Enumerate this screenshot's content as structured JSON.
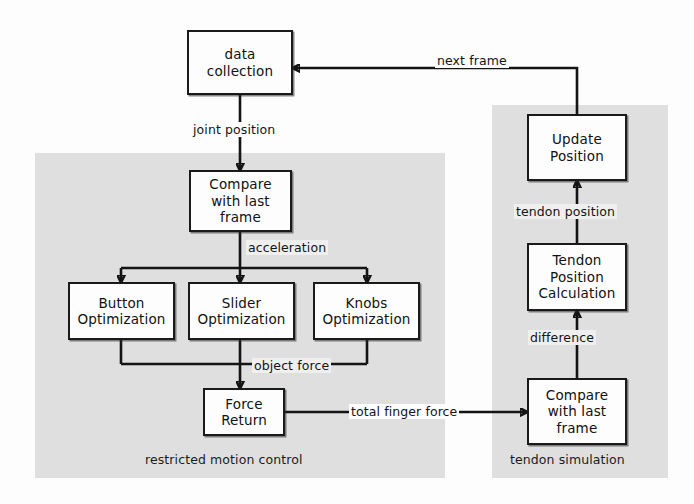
{
  "diagram": {
    "panels": [
      {
        "id": "restricted-motion-control",
        "label": "restricted motion control",
        "color": "#dcdcdc"
      },
      {
        "id": "tendon-simulation",
        "label": "tendon simulation",
        "color": "#dcdcdc"
      }
    ],
    "nodes": {
      "data_collection": "data collection",
      "compare_last_frame_left": "Compare with last frame",
      "button_optimization": "Button Optimization",
      "slider_optimization": "Slider Optimization",
      "knobs_optimization": "Knobs Optimization",
      "force_return": "Force Return",
      "update_position": "Update Position",
      "tendon_position_calculation": "Tendon Position Calculation",
      "compare_last_frame_right": "Compare with last frame"
    },
    "node_lines": {
      "data_collection": [
        "data",
        "collection"
      ],
      "compare_last_frame_left": [
        "Compare",
        "with last",
        "frame"
      ],
      "button_optimization": [
        "Button",
        "Optimization"
      ],
      "slider_optimization": [
        "Slider",
        "Optimization"
      ],
      "knobs_optimization": [
        "Knobs",
        "Optimization"
      ],
      "force_return": [
        "Force",
        "Return"
      ],
      "update_position": [
        "Update",
        "Position"
      ],
      "tendon_position_calculation": [
        "Tendon",
        "Position",
        "Calculation"
      ],
      "compare_last_frame_right": [
        "Compare",
        "with last",
        "frame"
      ]
    },
    "edge_labels": {
      "joint_position": "joint position",
      "acceleration": "acceleration",
      "object_force": "object force",
      "total_finger_force": "total finger force",
      "difference": "difference",
      "tendon_position": "tendon position",
      "next_frame": "next frame"
    }
  }
}
